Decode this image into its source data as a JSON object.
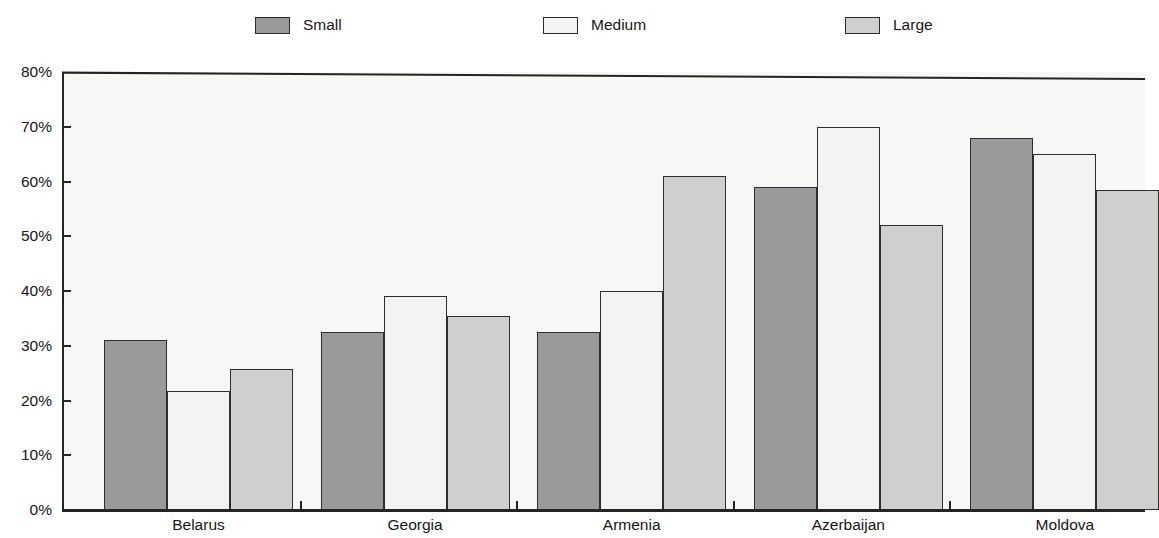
{
  "chart_data": {
    "type": "bar",
    "title": "",
    "subtitle": "",
    "xlabel": "",
    "ylabel": "",
    "ylim": [
      0,
      80
    ],
    "y_tick_labels": [
      "0%",
      "10%",
      "20%",
      "30%",
      "40%",
      "50%",
      "60%",
      "70%",
      "80%"
    ],
    "y_tick_values": [
      0,
      10,
      20,
      30,
      40,
      50,
      60,
      70,
      80
    ],
    "grid": false,
    "legend_position": "top",
    "categories": [
      "Belarus",
      "Georgia",
      "Armenia",
      "Azerbaijan",
      "Moldova"
    ],
    "series": [
      {
        "name": "Small",
        "color": "#9a9a9a",
        "values": [
          31.0,
          32.5,
          32.5,
          59.0,
          68.0
        ]
      },
      {
        "name": "Medium",
        "color": "#f3f3f1",
        "values": [
          21.7,
          39.0,
          40.0,
          70.0,
          65.0
        ]
      },
      {
        "name": "Large",
        "color": "#cfcfcd",
        "values": [
          25.7,
          35.5,
          61.0,
          52.0,
          58.5
        ]
      }
    ]
  },
  "legend": {
    "items": [
      {
        "label": "Small",
        "swatch": "legend-swatch-small"
      },
      {
        "label": "Medium",
        "swatch": "legend-swatch-medium"
      },
      {
        "label": "Large",
        "swatch": "legend-swatch-large"
      }
    ]
  },
  "axes": {
    "y": {
      "labels": [
        "80%",
        "70%",
        "60%",
        "50%",
        "40%",
        "30%",
        "20%",
        "10%",
        "0%"
      ]
    },
    "x": {
      "labels": [
        "Belarus",
        "Georgia",
        "Armenia",
        "Azerbaijan",
        "Moldova"
      ]
    }
  }
}
